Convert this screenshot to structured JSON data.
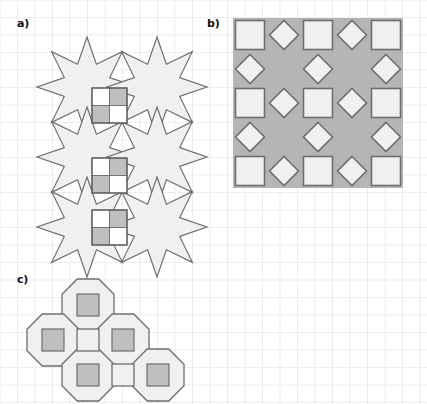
{
  "figure": {
    "width": 427,
    "height": 404,
    "background": "#ffffff",
    "caption_labels": [
      "a)",
      "b)",
      "c)"
    ]
  },
  "grid": {
    "name": "graph-paper-grid",
    "spacing_px": 17.5,
    "line_color": "#e9eef2",
    "visible": true
  },
  "palette": {
    "tile_fill_light": "#f0f0f0",
    "tile_fill_white": "#ffffff",
    "tile_fill_gray": "#bfbfbf",
    "panel_b_background": "#b5b5b5",
    "stroke": "#6e6e6e",
    "stroke_dark": "#555555",
    "label_color": "#111111"
  },
  "panels": [
    {
      "id": "panel-a",
      "label": "a)",
      "label_x": 17,
      "label_y": 18,
      "description": "eight-pointed star tiling with checkerboard square tiles",
      "origin_x": 27,
      "origin_y": 17,
      "cell": 35,
      "star_points": 8,
      "stars": [
        {
          "cx": 87,
          "cy": 87
        },
        {
          "cx": 157,
          "cy": 87
        },
        {
          "cx": 87,
          "cy": 157
        },
        {
          "cx": 157,
          "cy": 157
        },
        {
          "cx": 87,
          "cy": 227
        },
        {
          "cx": 157,
          "cy": 227
        }
      ],
      "checker_tiles": [
        {
          "x": 92,
          "y": 88,
          "size": 35,
          "pattern": [
            "white",
            "gray",
            "gray",
            "white"
          ]
        },
        {
          "x": 92,
          "y": 158,
          "size": 35,
          "pattern": [
            "white",
            "gray",
            "gray",
            "white"
          ]
        },
        {
          "x": 92,
          "y": 210,
          "size": 35,
          "pattern": [
            "white",
            "gray",
            "gray",
            "white"
          ]
        }
      ]
    },
    {
      "id": "panel-b",
      "label": "b)",
      "label_x": 207,
      "label_y": 18,
      "description": "five by five square and diamond tiling on gray ground",
      "origin_x": 233,
      "origin_y": 18,
      "cell": 34,
      "rows": 5,
      "cols": 5,
      "cell_types": [
        [
          "square",
          "diamond",
          "square",
          "diamond",
          "square"
        ],
        [
          "diamond",
          "empty",
          "diamond",
          "empty",
          "diamond"
        ],
        [
          "square",
          "diamond",
          "square",
          "diamond",
          "square"
        ],
        [
          "diamond",
          "empty",
          "diamond",
          "empty",
          "diamond"
        ],
        [
          "square",
          "diamond",
          "square",
          "diamond",
          "square"
        ]
      ]
    },
    {
      "id": "panel-c",
      "label": "c)",
      "label_x": 17,
      "label_y": 274,
      "description": "octagon and small square tiling cluster",
      "octagon_size": 52,
      "octagons": [
        {
          "cx": 88,
          "cy": 305
        },
        {
          "cx": 53,
          "cy": 340
        },
        {
          "cx": 123,
          "cy": 340
        },
        {
          "cx": 88,
          "cy": 375
        },
        {
          "cx": 158,
          "cy": 375
        }
      ],
      "inner_square_size": 22,
      "joint_squares": [
        {
          "cx": 88,
          "cy": 340,
          "size": 22
        },
        {
          "cx": 123,
          "cy": 375,
          "size": 22
        }
      ]
    }
  ]
}
